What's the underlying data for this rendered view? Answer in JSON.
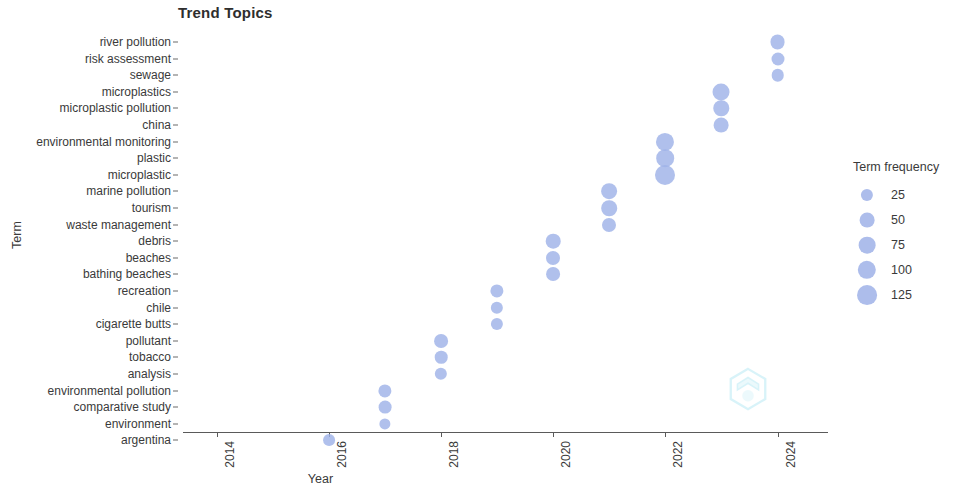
{
  "chart_data": {
    "type": "scatter",
    "title": "Trend Topics",
    "xlabel": "Year",
    "ylabel": "Term",
    "grid": false,
    "xlim": [
      2013.3,
      2024.8
    ],
    "xticks": [
      "2014",
      "2016",
      "2018",
      "2020",
      "2022",
      "2024"
    ],
    "xtick_values": [
      2014,
      2016,
      2018,
      2020,
      2022,
      2024
    ],
    "categories": [
      "river pollution",
      "risk assessment",
      "sewage",
      "microplastics",
      "microplastic pollution",
      "china",
      "environmental monitoring",
      "plastic",
      "microplastic",
      "marine pollution",
      "tourism",
      "waste management",
      "debris",
      "beaches",
      "bathing beaches",
      "recreation",
      "chile",
      "cigarette butts",
      "pollutant",
      "tobacco",
      "analysis",
      "environmental pollution",
      "comparative study",
      "environment",
      "argentina"
    ],
    "points": [
      {
        "term": "river pollution",
        "year": 2024,
        "freq": 52
      },
      {
        "term": "risk assessment",
        "year": 2024,
        "freq": 32
      },
      {
        "term": "sewage",
        "year": 2024,
        "freq": 28
      },
      {
        "term": "microplastics",
        "year": 2023,
        "freq": 78
      },
      {
        "term": "microplastic pollution",
        "year": 2023,
        "freq": 58
      },
      {
        "term": "china",
        "year": 2023,
        "freq": 50
      },
      {
        "term": "environmental monitoring",
        "year": 2022,
        "freq": 95
      },
      {
        "term": "plastic",
        "year": 2022,
        "freq": 88
      },
      {
        "term": "microplastic",
        "year": 2022,
        "freq": 128
      },
      {
        "term": "marine pollution",
        "year": 2021,
        "freq": 62
      },
      {
        "term": "tourism",
        "year": 2021,
        "freq": 60
      },
      {
        "term": "waste management",
        "year": 2021,
        "freq": 42
      },
      {
        "term": "debris",
        "year": 2020,
        "freq": 48
      },
      {
        "term": "beaches",
        "year": 2020,
        "freq": 42
      },
      {
        "term": "bathing beaches",
        "year": 2020,
        "freq": 40
      },
      {
        "term": "recreation",
        "year": 2019,
        "freq": 34
      },
      {
        "term": "chile",
        "year": 2019,
        "freq": 26
      },
      {
        "term": "cigarette butts",
        "year": 2019,
        "freq": 25
      },
      {
        "term": "pollutant",
        "year": 2018,
        "freq": 40
      },
      {
        "term": "tobacco",
        "year": 2018,
        "freq": 28
      },
      {
        "term": "analysis",
        "year": 2018,
        "freq": 26
      },
      {
        "term": "environmental pollution",
        "year": 2017,
        "freq": 34
      },
      {
        "term": "comparative study",
        "year": 2017,
        "freq": 30
      },
      {
        "term": "environment",
        "year": 2017,
        "freq": 18
      },
      {
        "term": "argentina",
        "year": 2016,
        "freq": 22
      }
    ],
    "point_color": "#9fb2e8"
  },
  "legend": {
    "title": "Term frequency",
    "position": "right",
    "entries": [
      {
        "label": "25",
        "value": 25
      },
      {
        "label": "50",
        "value": 50
      },
      {
        "label": "75",
        "value": 75
      },
      {
        "label": "100",
        "value": 100
      },
      {
        "label": "125",
        "value": 125
      }
    ]
  },
  "watermark": {
    "name": "hexagon-logo-watermark",
    "color": "#7fd8ec"
  }
}
